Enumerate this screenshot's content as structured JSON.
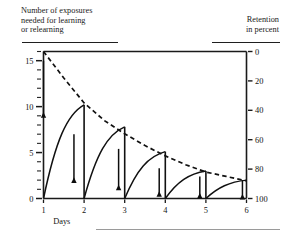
{
  "titles": {
    "left": "Number of exposures\nneeded for learning\nor relearning",
    "right": "Retention\nin percent"
  },
  "chart_data": {
    "type": "line",
    "title": "Number of exposures needed for learning or relearning",
    "subtitle": "Retention in percent",
    "xlabel": "Days",
    "ylabel": "Number of exposures needed for learning or relearning",
    "y2label": "Retention in percent",
    "xlim": [
      1,
      6
    ],
    "ylim": [
      16,
      0
    ],
    "y2lim": [
      0,
      100
    ],
    "grid": false,
    "legend": null,
    "x_ticks": [
      "1",
      "2",
      "3",
      "4",
      "5",
      "6"
    ],
    "y_ticks_left": [
      "0",
      "5",
      "10",
      "15"
    ],
    "y_ticks_right": [
      "100",
      "80",
      "60",
      "40",
      "20",
      "0"
    ],
    "y_minor_step_left": 1,
    "series": [
      {
        "name": "Forgetting curves (exposures needed)",
        "style": "solid",
        "axis": "left",
        "segments": [
          {
            "day_start": 1,
            "day_end": 2,
            "y_start": 0,
            "y_end": 10.2
          },
          {
            "day_start": 2,
            "day_end": 3,
            "y_start": 0,
            "y_end": 7.8
          },
          {
            "day_start": 3,
            "day_end": 4,
            "y_start": 0,
            "y_end": 5.1
          },
          {
            "day_start": 4,
            "day_end": 5,
            "y_start": 0,
            "y_end": 3.0
          },
          {
            "day_start": 5,
            "day_end": 6,
            "y_start": 0,
            "y_end": 2.0
          }
        ]
      },
      {
        "name": "Retention curve",
        "style": "dashed",
        "axis": "right",
        "x": [
          1,
          1.5,
          2,
          2.5,
          3,
          3.5,
          4,
          4.5,
          5,
          5.5,
          6
        ],
        "values": [
          0,
          18,
          35,
          47,
          56,
          64,
          71,
          77,
          82,
          85,
          88
        ]
      }
    ],
    "annotations": [
      {
        "type": "up-arrow",
        "day": 1.0,
        "y_from": 15.0,
        "y_to": 9.4,
        "label": "relearning gain"
      },
      {
        "type": "up-arrow",
        "day": 1.75,
        "y_from": 7.0,
        "y_to": 2.3,
        "label": "relearning gain"
      },
      {
        "type": "up-arrow",
        "day": 2.85,
        "y_from": 5.4,
        "y_to": 1.5,
        "label": "relearning gain"
      },
      {
        "type": "up-arrow",
        "day": 3.85,
        "y_from": 3.3,
        "y_to": 0.8,
        "label": "relearning gain"
      },
      {
        "type": "up-arrow",
        "day": 4.85,
        "y_from": 2.4,
        "y_to": 0.6,
        "label": "relearning gain"
      },
      {
        "type": "up-arrow",
        "day": 5.9,
        "y_from": 2.0,
        "y_to": 0.5,
        "label": "relearning gain"
      }
    ]
  }
}
